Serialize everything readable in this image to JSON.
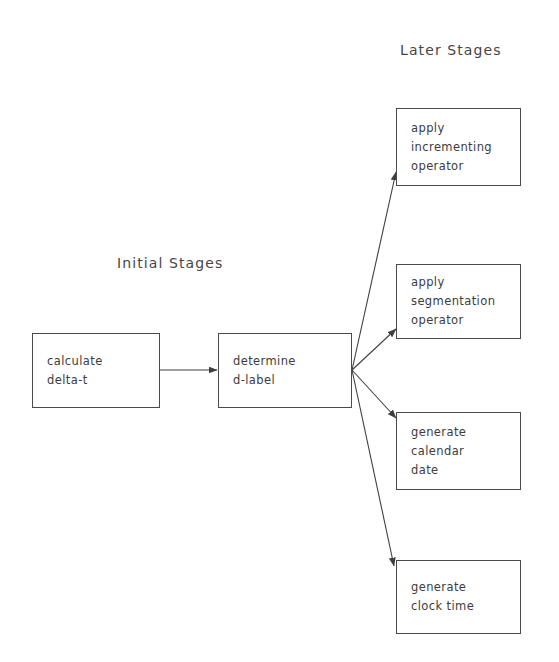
{
  "diagram": {
    "title_labels": {
      "initial": "Initial Stages",
      "later": "Later Stages"
    },
    "nodes": [
      {
        "id": "calculate-delta-t",
        "lines": [
          "calculate",
          "delta-t"
        ]
      },
      {
        "id": "determine-d-label",
        "lines": [
          "determine",
          "d-label"
        ]
      },
      {
        "id": "apply-incrementing-operator",
        "lines": [
          "apply",
          "incrementing",
          "operator"
        ]
      },
      {
        "id": "apply-segmentation-operator",
        "lines": [
          "apply",
          "segmentation",
          "operator"
        ]
      },
      {
        "id": "generate-calendar-date",
        "lines": [
          "generate",
          "calendar",
          "date"
        ]
      },
      {
        "id": "generate-clock-time",
        "lines": [
          "generate",
          "clock time"
        ]
      }
    ],
    "edges": [
      {
        "id": "calculate-to-determine",
        "from": "calculate-delta-t",
        "to": "determine-d-label"
      },
      {
        "id": "determine-to-incrementing",
        "from": "determine-d-label",
        "to": "apply-incrementing-operator"
      },
      {
        "id": "determine-to-segmentation",
        "from": "determine-d-label",
        "to": "apply-segmentation-operator"
      },
      {
        "id": "determine-to-calendar",
        "from": "determine-d-label",
        "to": "generate-calendar-date"
      },
      {
        "id": "determine-to-clock",
        "from": "determine-d-label",
        "to": "generate-clock-time"
      }
    ],
    "colors": {
      "background": "#ffffff",
      "box_border": "#4a4a4a",
      "text": "#3c3c3c",
      "label_text": "#464646",
      "edge": "#3f3f3f"
    }
  }
}
